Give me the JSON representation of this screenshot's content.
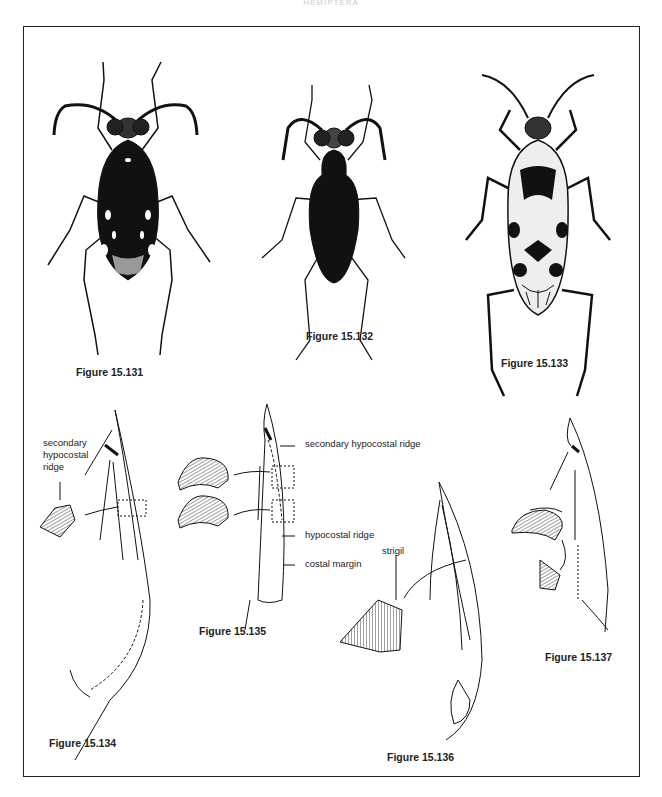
{
  "page": {
    "running_head": "HEMIPTERA"
  },
  "figures": [
    {
      "id": "15.131",
      "caption": "Figure 15.131",
      "type": "insect-dorsal-view"
    },
    {
      "id": "15.132",
      "caption": "Figure 15.132",
      "type": "insect-dorsal-view"
    },
    {
      "id": "15.133",
      "caption": "Figure 15.133",
      "type": "insect-dorsal-view"
    },
    {
      "id": "15.134",
      "caption": "Figure 15.134",
      "type": "wing-diagram",
      "labels": [
        "secondary",
        "hypocostal",
        "ridge"
      ]
    },
    {
      "id": "15.135",
      "caption": "Figure 15.135",
      "type": "wing-diagram",
      "labels": [
        "secondary hypocostal ridge",
        "hypocostal ridge",
        "costal margin"
      ]
    },
    {
      "id": "15.136",
      "caption": "Figure 15.136",
      "type": "wing-diagram",
      "labels": [
        "strigil"
      ]
    },
    {
      "id": "15.137",
      "caption": "Figure 15.137",
      "type": "wing-diagram"
    }
  ],
  "colors": {
    "ink": "#111111",
    "frame": "#222222",
    "background": "#ffffff"
  }
}
